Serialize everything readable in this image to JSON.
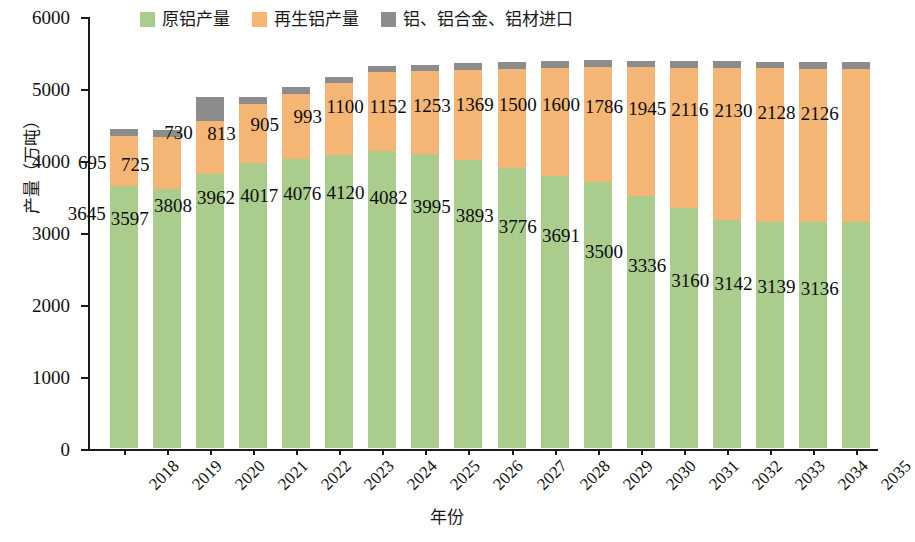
{
  "chart_data": {
    "type": "bar",
    "subtype": "stacked-bar",
    "title": "",
    "xlabel": "年份",
    "ylabel": "产量（万吨）",
    "ylim": [
      0,
      6000
    ],
    "ytick_labels": [
      "0",
      "1000",
      "2000",
      "3000",
      "4000",
      "5000",
      "6000"
    ],
    "ytick_values": [
      0,
      1000,
      2000,
      3000,
      4000,
      5000,
      6000
    ],
    "grid": false,
    "legend_position": "top",
    "categories": [
      "2018",
      "2019",
      "2020",
      "2021",
      "2022",
      "2023",
      "2024",
      "2025",
      "2026",
      "2027",
      "2028",
      "2029",
      "2030",
      "2031",
      "2032",
      "2033",
      "2034",
      "2035"
    ],
    "series": [
      {
        "name": "原铝产量",
        "color": "#aacd8d",
        "values": [
          3645,
          3597,
          3808,
          3962,
          4017,
          4076,
          4120,
          4082,
          3995,
          3893,
          3776,
          3691,
          3500,
          3336,
          3160,
          3142,
          3139,
          3136
        ]
      },
      {
        "name": "再生铝产量",
        "color": "#f5b675",
        "values": [
          695,
          725,
          730,
          813,
          905,
          993,
          1100,
          1152,
          1253,
          1369,
          1500,
          1600,
          1786,
          1945,
          2116,
          2130,
          2128,
          2126
        ]
      },
      {
        "name": "铝、铝合金、铝材进口",
        "color": "#8c8c8c",
        "values": [
          90,
          90,
          340,
          105,
          90,
          80,
          80,
          80,
          95,
          100,
          100,
          105,
          95,
          95,
          95,
          95,
          95,
          95
        ]
      }
    ]
  },
  "legend": {
    "entries": [
      {
        "label": "原铝产量",
        "color": "#aacd8d"
      },
      {
        "label": "再生铝产量",
        "color": "#f5b675"
      },
      {
        "label": "铝、铝合金、铝材进口",
        "color": "#8c8c8c"
      }
    ]
  },
  "axes": {
    "y_title": "产量（万吨）",
    "x_title": "年份"
  }
}
